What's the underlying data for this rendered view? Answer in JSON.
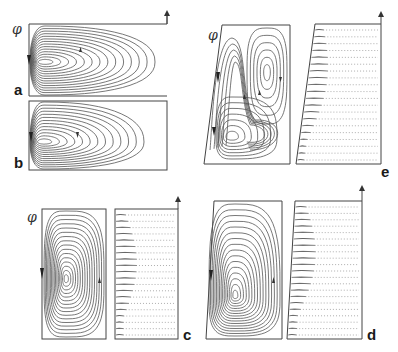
{
  "figure": {
    "symbol": "φ",
    "panels": [
      {
        "id": "a",
        "label": "a",
        "type": "streamfunction",
        "psi_label": "φ",
        "cells": 1,
        "shape": "horizontal-half-ellipse"
      },
      {
        "id": "b",
        "label": "b",
        "type": "streamfunction",
        "psi_label": "",
        "cells": 1,
        "shape": "horizontal-half-ellipse"
      },
      {
        "id": "e",
        "label": "e",
        "type": "streamfunction+velocity",
        "psi_label": "φ",
        "cells": 2,
        "shape": "two-cell"
      },
      {
        "id": "c",
        "label": "c",
        "type": "streamfunction+velocity",
        "psi_label": "φ",
        "cells": 1,
        "shape": "single-cell"
      },
      {
        "id": "d",
        "label": "d",
        "type": "streamfunction+velocity",
        "psi_label": "",
        "cells": 1,
        "shape": "single-cell-tapered"
      }
    ]
  },
  "colors": {
    "ink": "#555555",
    "frame": "#444444",
    "background": "#ffffff"
  }
}
